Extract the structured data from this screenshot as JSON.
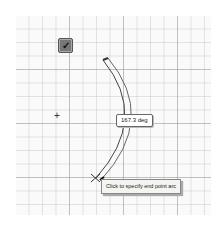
{
  "sketch": {
    "confirm_icon": "checkmark-icon",
    "confirm_glyph": "✓",
    "center_glyph": "+",
    "arc_angle_label": "167.3 deg",
    "tooltip": "Click to specify end point arc"
  },
  "colors": {
    "grid_major": "#969696",
    "grid_minor": "#c8c8c8",
    "arc_stroke": "#444444",
    "background": "#fafafa"
  }
}
